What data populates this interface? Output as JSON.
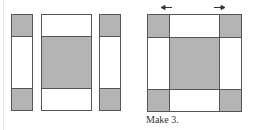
{
  "diagram": {
    "colors": {
      "dark_fabric": "#b4b4b4",
      "light_fabric": "#ffffff",
      "outline": "#555555"
    },
    "left_panel": {
      "pieces": [
        {
          "name": "left-strip",
          "segments": [
            "dark",
            "light",
            "dark"
          ]
        },
        {
          "name": "center-unit",
          "segments": [
            "light",
            "dark",
            "light"
          ]
        },
        {
          "name": "right-strip",
          "segments": [
            "dark",
            "light",
            "dark"
          ]
        }
      ]
    },
    "right_panel": {
      "grid": [
        [
          "dark",
          "light",
          "dark"
        ],
        [
          "light",
          "dark",
          "light"
        ],
        [
          "dark",
          "light",
          "dark"
        ]
      ],
      "pressing_arrows": [
        "left",
        "right"
      ],
      "caption": "Make 3."
    }
  }
}
